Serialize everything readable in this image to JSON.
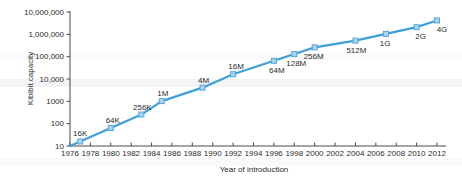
{
  "chart_data": {
    "type": "line",
    "title": "",
    "xlabel": "Year of introduction",
    "ylabel": "Kibibit capacity",
    "y_scale": "log",
    "grid": false,
    "legend": "none",
    "xlim": [
      1976,
      2012
    ],
    "ylim": [
      10,
      10000000
    ],
    "x_ticks": [
      1976,
      1978,
      1980,
      1982,
      1984,
      1986,
      1988,
      1990,
      1992,
      1994,
      1996,
      1998,
      2000,
      2002,
      2004,
      2006,
      2008,
      2010,
      2012
    ],
    "y_ticks": [
      {
        "label": "10",
        "value": 10
      },
      {
        "label": "100",
        "value": 100
      },
      {
        "label": "1000",
        "value": 1000
      },
      {
        "label": "10,000",
        "value": 10000
      },
      {
        "label": "100,000",
        "value": 100000
      },
      {
        "label": "1,000,000",
        "value": 1000000
      },
      {
        "label": "10,000,000",
        "value": 10000000
      }
    ],
    "line_start": {
      "year": 1976,
      "kibibits": 10
    },
    "points": [
      {
        "year": 1977,
        "label": "16K",
        "kibibits": 16,
        "label_side": "above",
        "label_dx": 0
      },
      {
        "year": 1980,
        "label": "64K",
        "kibibits": 64,
        "label_side": "above",
        "label_dx": 2
      },
      {
        "year": 1983,
        "label": "256K",
        "kibibits": 256,
        "label_side": "above",
        "label_dx": 1
      },
      {
        "year": 1985,
        "label": "1M",
        "kibibits": 1024,
        "label_side": "above",
        "label_dx": 1
      },
      {
        "year": 1989,
        "label": "4M",
        "kibibits": 4096,
        "label_side": "above",
        "label_dx": 1
      },
      {
        "year": 1992,
        "label": "16M",
        "kibibits": 16384,
        "label_side": "above",
        "label_dx": 3
      },
      {
        "year": 1996,
        "label": "64M",
        "kibibits": 65536,
        "label_side": "below",
        "label_dx": 3
      },
      {
        "year": 1998,
        "label": "128M",
        "kibibits": 131072,
        "label_side": "below",
        "label_dx": 2
      },
      {
        "year": 2000,
        "label": "256M",
        "kibibits": 262144,
        "label_side": "below",
        "label_dx": -1
      },
      {
        "year": 2004,
        "label": "512M",
        "kibibits": 524288,
        "label_side": "below",
        "label_dx": 1
      },
      {
        "year": 2007,
        "label": "1G",
        "kibibits": 1048576,
        "label_side": "below",
        "label_dx": -1
      },
      {
        "year": 2010,
        "label": "2G",
        "kibibits": 2097152,
        "label_side": "below",
        "label_dx": 4
      },
      {
        "year": 2012,
        "label": "4G",
        "kibibits": 4194304,
        "label_side": "below",
        "label_dx": 5
      }
    ],
    "colors": {
      "line": "#3e9fd6",
      "marker_fill": "#a9d4ee",
      "marker_stroke": "#58a6d8",
      "axis": "#4a4a4a",
      "text": "#2b2b2b"
    }
  }
}
